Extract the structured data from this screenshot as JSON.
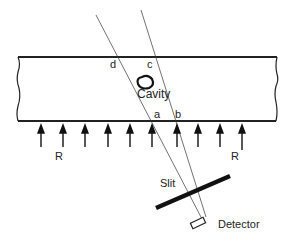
{
  "diagram": {
    "labels": {
      "d": "d",
      "c": "c",
      "a": "a",
      "b": "b",
      "cavity": "Cavity",
      "r_left": "R",
      "r_right": "R",
      "slit": "Slit",
      "detector": "Detector"
    },
    "arrow_count": 10,
    "colors": {
      "line": "#222222",
      "background": "#ffffff"
    }
  }
}
